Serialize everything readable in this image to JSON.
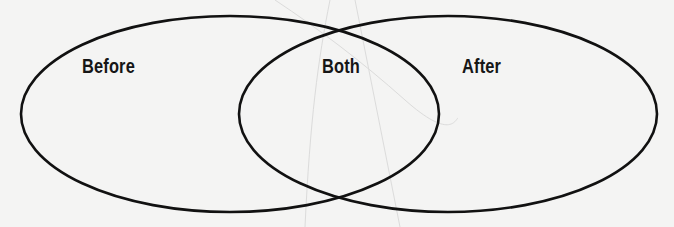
{
  "diagram": {
    "type": "venn",
    "sets": [
      {
        "id": "before",
        "label": "Before",
        "shape": "ellipse",
        "cx": 230,
        "cy": 114,
        "rx": 209,
        "ry": 98
      },
      {
        "id": "after",
        "label": "After",
        "shape": "ellipse",
        "cx": 448,
        "cy": 114,
        "rx": 209,
        "ry": 98
      }
    ],
    "intersection": {
      "label": "Both"
    },
    "stroke_color": "#111111",
    "background_color": "#f4f4f3"
  }
}
